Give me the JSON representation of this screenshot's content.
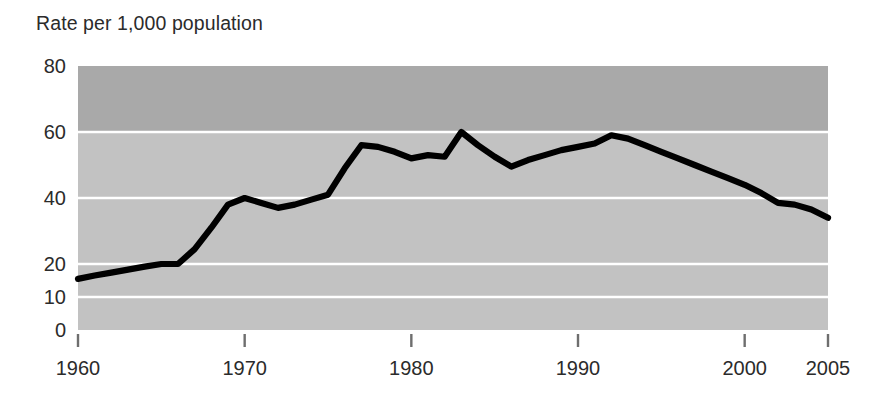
{
  "chart_data": {
    "type": "line",
    "title": "Rate per 1,000 population",
    "xlabel": "",
    "ylabel": "",
    "xlim": [
      1960,
      2005
    ],
    "ylim": [
      0,
      80
    ],
    "grid": true,
    "grid_values": [
      10,
      20,
      40,
      60
    ],
    "legend": null,
    "y_ticks": [
      0,
      10,
      20,
      40,
      60,
      80
    ],
    "y_tick_labels": [
      "0",
      "10",
      "20",
      "40",
      "60",
      "80"
    ],
    "x_ticks": [
      1960,
      1970,
      1980,
      1990,
      2000,
      2005
    ],
    "x_tick_labels": [
      "1960",
      "1970",
      "1980",
      "1990",
      "2000",
      "2005"
    ],
    "series": [
      {
        "name": "Rate per 1,000 population",
        "color": "#000000",
        "x": [
          1960,
          1961,
          1962,
          1963,
          1964,
          1965,
          1966,
          1967,
          1968,
          1969,
          1970,
          1971,
          1972,
          1973,
          1974,
          1975,
          1976,
          1977,
          1978,
          1979,
          1980,
          1981,
          1982,
          1983,
          1984,
          1985,
          1986,
          1987,
          1988,
          1989,
          1990,
          1991,
          1992,
          1993,
          1994,
          1995,
          1996,
          1997,
          1998,
          1999,
          2000,
          2001,
          2002,
          2003,
          2004,
          2005
        ],
        "values": [
          15.5,
          16.5,
          17.4,
          18.3,
          19.2,
          20.0,
          20.0,
          24.5,
          31.0,
          38.0,
          40.0,
          38.5,
          37.0,
          38.0,
          39.5,
          41.0,
          49.0,
          56.0,
          55.5,
          54.0,
          52.0,
          53.0,
          52.5,
          60.0,
          56.0,
          52.5,
          49.5,
          51.5,
          53.0,
          54.5,
          55.5,
          56.5,
          59.0,
          58.0,
          56.0,
          54.0,
          52.0,
          50.0,
          48.0,
          46.0,
          44.0,
          41.5,
          38.5,
          38.0,
          36.5,
          34.0
        ]
      }
    ],
    "colors": {
      "line": "#000000",
      "band_upper": "#a9a9a9",
      "band_lower": "#c2c2c2",
      "gridline": "#ffffff",
      "axis_text": "#2b2b2b",
      "tick_mark": "#6e6e6e",
      "page_background": "#ffffff"
    }
  }
}
